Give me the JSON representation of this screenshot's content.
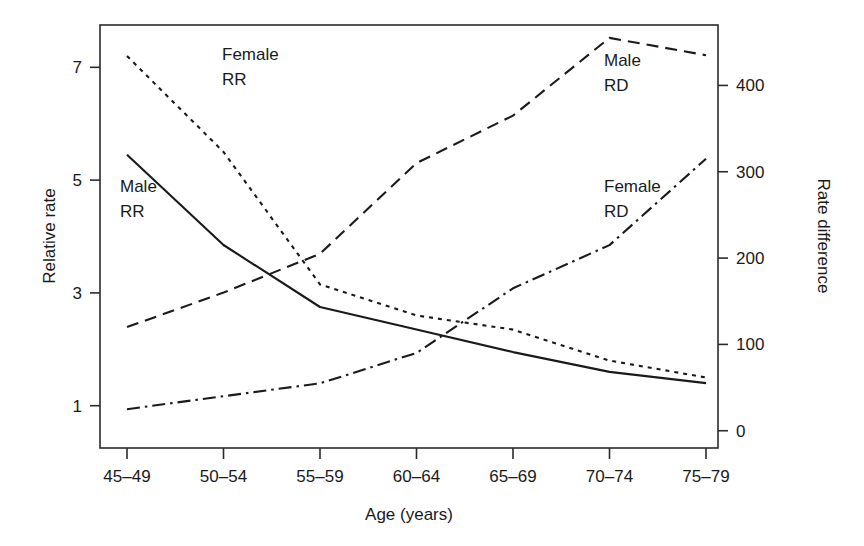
{
  "chart_data": {
    "type": "line",
    "title": "",
    "xlabel": "Age (years)",
    "ylabel": "Relative rate",
    "y2label": "Rate difference",
    "categories": [
      "45–49",
      "50–54",
      "55–59",
      "60–64",
      "65–69",
      "70–74",
      "75–79"
    ],
    "yticks": [
      "1",
      "3",
      "5",
      "7"
    ],
    "ytick_values": [
      1,
      3,
      5,
      7
    ],
    "ylim": [
      0.25,
      7.75
    ],
    "y2ticks": [
      "0",
      "100",
      "200",
      "300",
      "400"
    ],
    "y2tick_values": [
      0,
      100,
      200,
      300,
      400
    ],
    "y2lim": [
      -20,
      470
    ],
    "grid": false,
    "legend_position": "inline-annotations",
    "series": [
      {
        "name": "Male RR",
        "label": "Male\nRR",
        "label_line1": "Male",
        "label_line2": "RR",
        "axis": "left",
        "style": "solid",
        "color": "#1a1a1a",
        "values": [
          5.45,
          3.85,
          2.75,
          2.35,
          1.95,
          1.6,
          1.4
        ]
      },
      {
        "name": "Female RR",
        "label": "Female\nRR",
        "label_line1": "Female",
        "label_line2": "RR",
        "axis": "left",
        "style": "dotted",
        "color": "#1a1a1a",
        "values": [
          7.2,
          5.5,
          3.15,
          2.6,
          2.35,
          1.8,
          1.5
        ]
      },
      {
        "name": "Male RD",
        "label": "Male\nRD",
        "label_line1": "Male",
        "label_line2": "RD",
        "axis": "right",
        "style": "dashed",
        "color": "#1a1a1a",
        "values": [
          120,
          160,
          205,
          310,
          365,
          455,
          435
        ]
      },
      {
        "name": "Female RD",
        "label": "Female\nRD",
        "label_line1": "Female",
        "label_line2": "RD",
        "axis": "right",
        "style": "dashdot",
        "color": "#1a1a1a",
        "values": [
          25,
          40,
          55,
          90,
          165,
          215,
          315
        ]
      }
    ],
    "annotations": [
      {
        "text_line1": "Female",
        "text_line2": "RR",
        "series": "Female RR",
        "x": 222,
        "y": 60
      },
      {
        "text_line1": "Male",
        "text_line2": "RR",
        "series": "Male RR",
        "x": 120,
        "y": 192
      },
      {
        "text_line1": "Male",
        "text_line2": "RD",
        "series": "Male RD",
        "x": 604,
        "y": 66
      },
      {
        "text_line1": "Female",
        "text_line2": "RD",
        "series": "Female RD",
        "x": 604,
        "y": 192
      }
    ]
  }
}
